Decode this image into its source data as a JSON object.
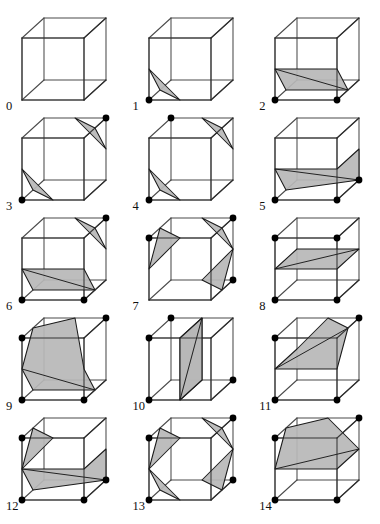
{
  "figure": {
    "case_count": 15,
    "colors": {
      "background": "#ffffff",
      "cube_edge": "#4a4a4a",
      "cube_edge_dark": "#262626",
      "surface_fill": "#b7b7b7",
      "surface_stroke": "#1a1a1a",
      "vertex_marker": "#000000",
      "label_text": "#101010"
    },
    "geometry": {
      "cube_front_face": "square",
      "depth_offset_x": 22,
      "depth_offset_y": -20,
      "cube_size": 62,
      "origin_x": 22,
      "origin_y": 86,
      "vertex_marker_radius": 3.4,
      "projection": "oblique cavalier"
    },
    "cases": [
      {
        "label": "0",
        "marked_corners": [],
        "polygons": []
      },
      {
        "label": "1",
        "marked_corners": [
          0
        ],
        "polygons": [
          [
            [
              0.5,
              0,
              0
            ],
            [
              0,
              0.5,
              0
            ],
            [
              0,
              0,
              0.5
            ]
          ]
        ]
      },
      {
        "label": "2",
        "marked_corners": [
          0,
          1
        ],
        "polygons": [
          [
            [
              0,
              0.5,
              0
            ],
            [
              0,
              0,
              0.5
            ],
            [
              1,
              0,
              0.5
            ],
            [
              1,
              0.5,
              0
            ]
          ]
        ]
      },
      {
        "label": "3",
        "marked_corners": [
          0,
          6
        ],
        "polygons": [
          [
            [
              0.5,
              0,
              0
            ],
            [
              0,
              0.5,
              0
            ],
            [
              0,
              0,
              0.5
            ]
          ],
          [
            [
              0.5,
              1,
              1
            ],
            [
              1,
              0.5,
              1
            ],
            [
              1,
              1,
              0.5
            ]
          ]
        ]
      },
      {
        "label": "4",
        "marked_corners": [
          0,
          7
        ],
        "polygons": [
          [
            [
              0.5,
              0,
              0
            ],
            [
              0,
              0.5,
              0
            ],
            [
              0,
              0,
              0.5
            ]
          ],
          [
            [
              0.5,
              1,
              1
            ],
            [
              1,
              1,
              0.5
            ],
            [
              1,
              0.5,
              1
            ]
          ]
        ]
      },
      {
        "label": "5",
        "marked_corners": [
          0,
          1,
          5
        ],
        "polygons": [
          [
            [
              0,
              0.5,
              0
            ],
            [
              0,
              0,
              0.5
            ],
            [
              1,
              0,
              1
            ],
            [
              1,
              0.5,
              1
            ],
            [
              1,
              0.5,
              0
            ]
          ]
        ]
      },
      {
        "label": "6",
        "marked_corners": [
          0,
          1,
          6
        ],
        "polygons": [
          [
            [
              0,
              0.5,
              0
            ],
            [
              0,
              0,
              0.5
            ],
            [
              1,
              0,
              0.5
            ],
            [
              1,
              0.5,
              0
            ]
          ],
          [
            [
              0.5,
              1,
              1
            ],
            [
              1,
              0.5,
              1
            ],
            [
              1,
              1,
              0.5
            ]
          ]
        ]
      },
      {
        "label": "7",
        "marked_corners": [
          2,
          6,
          5
        ],
        "polygons": [
          [
            [
              0.5,
              1,
              0
            ],
            [
              0,
              0.5,
              0
            ],
            [
              0,
              1,
              0.5
            ]
          ],
          [
            [
              0.5,
              1,
              1
            ],
            [
              1,
              1,
              0.5
            ],
            [
              1,
              0.5,
              1
            ]
          ],
          [
            [
              0.5,
              0,
              1
            ],
            [
              1,
              0,
              0.5
            ],
            [
              1,
              0.5,
              1
            ]
          ]
        ]
      },
      {
        "label": "8",
        "marked_corners": [
          0,
          1,
          2,
          3
        ],
        "polygons": [
          [
            [
              0,
              0.5,
              0
            ],
            [
              1,
              0.5,
              0
            ],
            [
              1,
              0.5,
              1
            ],
            [
              0,
              0.5,
              1
            ]
          ]
        ]
      },
      {
        "label": "9",
        "marked_corners": [
          0,
          1,
          2,
          6
        ],
        "polygons": [
          [
            [
              0,
              0.5,
              0
            ],
            [
              0,
              0,
              0.5
            ],
            [
              1,
              0,
              0.5
            ],
            [
              1,
              0.5,
              0
            ],
            [
              0.5,
              1,
              1
            ],
            [
              0,
              1,
              0.5
            ]
          ]
        ]
      },
      {
        "label": "10",
        "marked_corners": [
          0,
          2,
          5,
          7
        ],
        "polygons": [
          [
            [
              0.5,
              0,
              0
            ],
            [
              0.5,
              1,
              0
            ],
            [
              0.5,
              1,
              1
            ],
            [
              0.5,
              0,
              1
            ]
          ],
          [
            [
              0.5,
              0,
              0
            ],
            [
              0.5,
              1,
              0
            ],
            [
              0.5,
              1,
              1
            ],
            [
              0.5,
              0,
              1
            ]
          ]
        ]
      },
      {
        "label": "11",
        "marked_corners": [
          0,
          1,
          2,
          6
        ],
        "polygons": [
          [
            [
              0,
              0.5,
              0
            ],
            [
              1,
              0.5,
              0
            ],
            [
              1,
              1,
              0.5
            ],
            [
              0.5,
              1,
              1
            ],
            [
              0,
              0.5,
              1
            ]
          ]
        ]
      },
      {
        "label": "12",
        "marked_corners": [
          0,
          1,
          5,
          2
        ],
        "polygons": [
          [
            [
              0,
              0.5,
              0
            ],
            [
              0,
              0,
              0.5
            ],
            [
              1,
              0,
              1
            ],
            [
              1,
              0.5,
              1
            ],
            [
              1,
              0.5,
              0
            ]
          ],
          [
            [
              0,
              1,
              0.5
            ],
            [
              0.5,
              1,
              0
            ],
            [
              0,
              0.5,
              0
            ]
          ]
        ]
      },
      {
        "label": "13",
        "marked_corners": [
          2,
          6,
          5,
          0
        ],
        "polygons": [
          [
            [
              0.5,
              1,
              0
            ],
            [
              0,
              0.5,
              0
            ],
            [
              0,
              1,
              0.5
            ]
          ],
          [
            [
              0.5,
              1,
              1
            ],
            [
              1,
              1,
              0.5
            ],
            [
              1,
              0.5,
              1
            ]
          ],
          [
            [
              0.5,
              0,
              1
            ],
            [
              1,
              0,
              0.5
            ],
            [
              1,
              0.5,
              1
            ]
          ],
          [
            [
              0.5,
              0,
              0
            ],
            [
              0,
              0.5,
              0
            ],
            [
              0,
              0,
              0.5
            ]
          ]
        ]
      },
      {
        "label": "14",
        "marked_corners": [
          0,
          1,
          2,
          6
        ],
        "polygons": [
          [
            [
              0,
              0.5,
              0
            ],
            [
              1,
              0.5,
              0
            ],
            [
              1,
              0.5,
              1
            ],
            [
              0.5,
              1,
              1
            ],
            [
              0,
              1,
              0.5
            ]
          ]
        ]
      }
    ]
  }
}
